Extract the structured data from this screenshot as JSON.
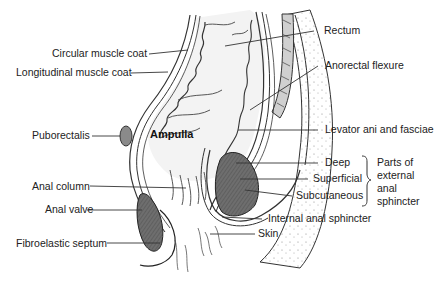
{
  "diagram": {
    "type": "anatomical-illustration",
    "labels": {
      "rectum": "Rectum",
      "circular_muscle_coat": "Circular muscle coat",
      "longitudinal_muscle_coat": "Longitudinal muscle coat",
      "anorectal_flexure": "Anorectal flexure",
      "puborectalis": "Puborectalis",
      "ampulla": "Ampulla",
      "levator_ani": "Levator ani and fasciae",
      "deep": "Deep",
      "superficial": "Superficial",
      "subcutaneous": "Subcutaneous",
      "anal_column": "Anal column",
      "anal_valve": "Anal valve",
      "internal_anal_sphincter": "Internal anal sphincter",
      "skin": "Skin",
      "fibroelastic_septum": "Fibroelastic septum"
    },
    "bracket_group": {
      "line1": "Parts of",
      "line2": "external",
      "line3": "anal",
      "line4": "sphincter"
    },
    "colors": {
      "ink": "#2a2a2a",
      "muscle_fill": "#6e6e6e",
      "tissue_fill": "#ededed",
      "background": "#ffffff"
    }
  }
}
